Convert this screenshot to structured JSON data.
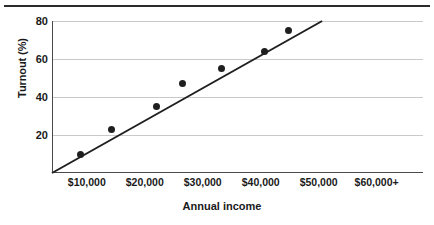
{
  "chart_data": {
    "type": "scatter",
    "title": "",
    "xlabel": "Annual income",
    "ylabel": "Turnout (%)",
    "x_tick_labels": [
      "$10,000",
      "$20,000",
      "$30,000",
      "$40,000",
      "$50,000",
      "$60,000+"
    ],
    "x_tick_values": [
      10000,
      20000,
      30000,
      40000,
      50000,
      60000
    ],
    "y_tick_labels": [
      "20",
      "40",
      "60",
      "80"
    ],
    "y_tick_values": [
      20,
      40,
      60,
      80
    ],
    "xlim": [
      4000,
      68000
    ],
    "ylim": [
      0,
      80
    ],
    "grid": "horizontal",
    "legend": "none",
    "series": [
      {
        "name": "Turnout by income",
        "marker": "filled-circle",
        "color": "#1f1f1f",
        "points": [
          {
            "x": 8900,
            "y": 10
          },
          {
            "x": 14200,
            "y": 23
          },
          {
            "x": 22000,
            "y": 35
          },
          {
            "x": 26500,
            "y": 47
          },
          {
            "x": 33300,
            "y": 55
          },
          {
            "x": 40600,
            "y": 64
          },
          {
            "x": 44800,
            "y": 75
          }
        ]
      },
      {
        "name": "Trend line",
        "type": "line",
        "color": "#1f1f1f",
        "points": [
          {
            "x": 4000,
            "y": 0
          },
          {
            "x": 50600,
            "y": 80
          }
        ]
      }
    ]
  },
  "figure": {
    "top_rule_color": "#2b2b2b",
    "gridline_color": "#c9c9c9",
    "axis_color": "#4a4a4a",
    "background": "#ffffff"
  }
}
